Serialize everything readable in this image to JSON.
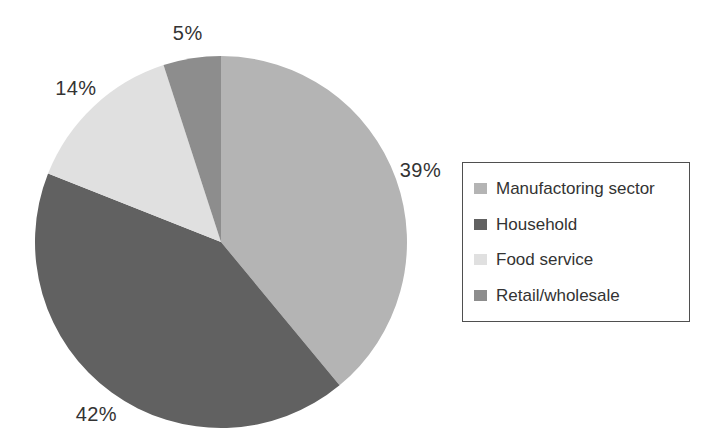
{
  "figure": {
    "background_color": "#ffffff",
    "text_color": "#333333",
    "legend_border_color": "#4f4f4f"
  },
  "chart_data": {
    "type": "pie",
    "title": "",
    "labels": [
      "Manufactoring sector",
      "Household",
      "Food service",
      "Retail/wholesale"
    ],
    "values": [
      39,
      42,
      14,
      5
    ],
    "data_labels": [
      "39%",
      "42%",
      "14%",
      "5%"
    ],
    "colors": [
      "#b4b4b4",
      "#616161",
      "#e0e0e0",
      "#8d8d8d"
    ],
    "start_angle": "12-oclock",
    "direction": "clockwise",
    "legend_position": "right",
    "grid": false
  }
}
